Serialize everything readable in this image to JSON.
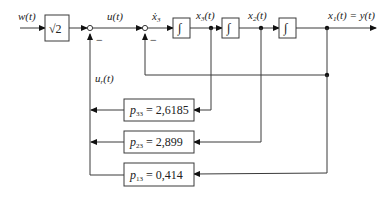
{
  "diagram": {
    "signals": {
      "input": "w(t)",
      "control": "u(t)",
      "feedback_control": "u",
      "feedback_control_sub": "r",
      "feedback_control_arg": "(t)",
      "x3dot": "ẋ",
      "x3dot_sub": "3",
      "x3": "x",
      "x3_sub": "3",
      "x2": "x",
      "x2_sub": "2",
      "x1_output": "x",
      "x1_output_sub": "1",
      "arg_t": "(t)",
      "output_eq": " = y(t)"
    },
    "blocks": {
      "prefilter": "√2",
      "integrator_symbol": "∫"
    },
    "summing_junctions": [
      {
        "name": "sum-1",
        "minus_sign": "−"
      },
      {
        "name": "sum-2",
        "minus_sign": "−"
      }
    ],
    "gains": [
      {
        "symbol": "p",
        "sub": "33",
        "value": " = 2,6185"
      },
      {
        "symbol": "p",
        "sub": "23",
        "value": " = 2,899"
      },
      {
        "symbol": "p",
        "sub": "13",
        "value": " = 0,414"
      }
    ]
  }
}
